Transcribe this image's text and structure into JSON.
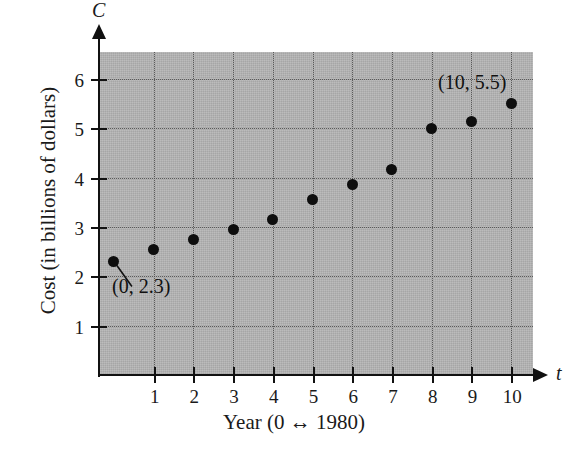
{
  "chart_data": {
    "type": "scatter",
    "title": "",
    "xlabel": "Year (0 ↔ 1980)",
    "ylabel": "Cost (in billions of dollars)",
    "x_axis_variable": "t",
    "y_axis_variable": "C",
    "x": [
      0,
      1,
      2,
      3,
      4,
      5,
      6,
      7,
      8,
      9,
      10
    ],
    "values": [
      2.3,
      2.55,
      2.75,
      2.95,
      3.15,
      3.55,
      3.87,
      4.17,
      5.0,
      5.15,
      5.5
    ],
    "xlim": [
      -0.35,
      10.55
    ],
    "ylim": [
      0,
      6.55
    ],
    "xticks": [
      1,
      2,
      3,
      4,
      5,
      6,
      7,
      8,
      9,
      10
    ],
    "yticks": [
      1,
      2,
      3,
      4,
      5,
      6
    ],
    "xtick_labels": [
      "1",
      "2",
      "3",
      "4",
      "5",
      "6",
      "7",
      "8",
      "9",
      "10"
    ],
    "ytick_labels": [
      "1",
      "2",
      "3",
      "4",
      "5",
      "6"
    ],
    "grid": true,
    "grid_style": "dotted",
    "legend": false,
    "plot_background": "#b5b5b5",
    "marker_color": "#0d0d0d",
    "annotations": [
      {
        "text": "(0, 2.3)",
        "point_x": 0,
        "point_y": 2.3,
        "leader": true
      },
      {
        "text": "(10, 5.5)",
        "point_x": 10,
        "point_y": 5.5,
        "leader": false
      }
    ]
  }
}
